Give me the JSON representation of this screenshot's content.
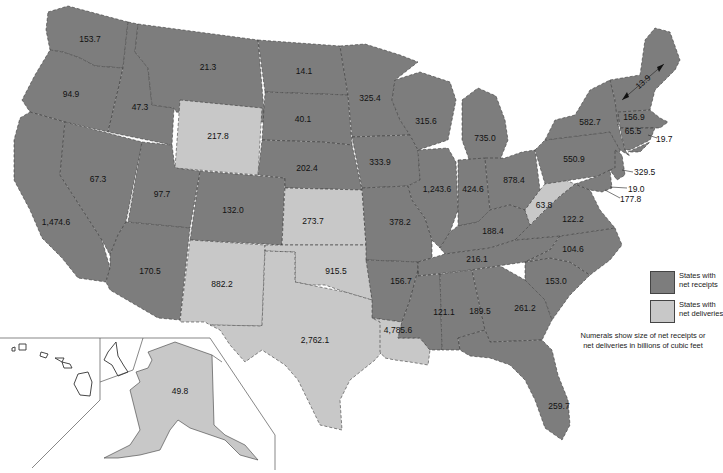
{
  "legend": {
    "receipts_line1": "States with",
    "receipts_line2": "net receipts",
    "deliveries_line1": "States with",
    "deliveries_line2": "net deliveries",
    "receipts_color": "#7d7d7d",
    "deliveries_color": "#c8c8c8",
    "note_line1": "Numerals show size of net receipts or",
    "note_line2": "net deliveries in billions of cubic feet"
  },
  "states": {
    "WA": {
      "value": "153.7",
      "type": "receipts"
    },
    "OR": {
      "value": "94.9",
      "type": "receipts"
    },
    "CA": {
      "value": "1,474.6",
      "type": "receipts"
    },
    "ID": {
      "value": "47.3",
      "type": "receipts"
    },
    "NV": {
      "value": "67.3",
      "type": "receipts"
    },
    "MT": {
      "value": "21.3",
      "type": "receipts"
    },
    "WY": {
      "value": "217.8",
      "type": "deliveries"
    },
    "UT": {
      "value": "97.7",
      "type": "receipts"
    },
    "CO": {
      "value": "132.0",
      "type": "receipts"
    },
    "AZ": {
      "value": "170.5",
      "type": "receipts"
    },
    "NM": {
      "value": "882.2",
      "type": "deliveries"
    },
    "ND": {
      "value": "14.1",
      "type": "receipts"
    },
    "SD": {
      "value": "40.1",
      "type": "receipts"
    },
    "NE": {
      "value": "202.4",
      "type": "receipts"
    },
    "KS": {
      "value": "273.7",
      "type": "deliveries"
    },
    "OK": {
      "value": "915.5",
      "type": "deliveries"
    },
    "TX": {
      "value": "2,762.1",
      "type": "deliveries"
    },
    "MN": {
      "value": "325.4",
      "type": "receipts"
    },
    "IA": {
      "value": "333.9",
      "type": "receipts"
    },
    "MO": {
      "value": "378.2",
      "type": "receipts"
    },
    "AR": {
      "value": "156.7",
      "type": "receipts"
    },
    "LA": {
      "value": "4,785.6",
      "type": "deliveries"
    },
    "WI": {
      "value": "315.6",
      "type": "receipts"
    },
    "IL": {
      "value": "1,243.6",
      "type": "receipts"
    },
    "MI": {
      "value": "735.0",
      "type": "receipts"
    },
    "IN": {
      "value": "424.6",
      "type": "receipts"
    },
    "OH": {
      "value": "878.4",
      "type": "receipts"
    },
    "KY": {
      "value": "188.4",
      "type": "receipts"
    },
    "TN": {
      "value": "216.1",
      "type": "receipts"
    },
    "MS": {
      "value": "121.1",
      "type": "receipts"
    },
    "AL": {
      "value": "189.5",
      "type": "receipts"
    },
    "GA": {
      "value": "261.2",
      "type": "receipts"
    },
    "FL": {
      "value": "259.7",
      "type": "receipts"
    },
    "SC": {
      "value": "153.0",
      "type": "receipts"
    },
    "NC": {
      "value": "104.6",
      "type": "receipts"
    },
    "VA": {
      "value": "122.2",
      "type": "receipts"
    },
    "WV": {
      "value": "63.8",
      "type": "deliveries"
    },
    "PA": {
      "value": "550.9",
      "type": "receipts"
    },
    "NY": {
      "value": "582.7",
      "type": "receipts"
    },
    "NE_NORTH": {
      "value": "13.9",
      "type": "receipts"
    },
    "MA": {
      "value": "156.9",
      "type": "receipts"
    },
    "CT": {
      "value": "65.5",
      "type": "receipts"
    },
    "RI": {
      "value": "19.7",
      "type": "receipts"
    },
    "NJ": {
      "value": "329.5",
      "type": "receipts"
    },
    "DE": {
      "value": "19.0",
      "type": "receipts"
    },
    "MD": {
      "value": "177.8",
      "type": "receipts"
    },
    "AK": {
      "value": "49.8",
      "type": "deliveries"
    }
  }
}
